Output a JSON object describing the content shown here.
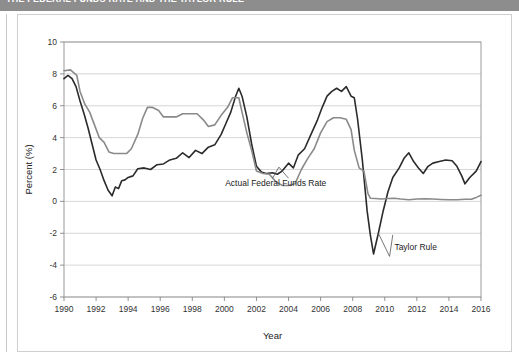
{
  "banner": {
    "caption": "THE FEDERAL FUNDS RATE AND THE TAYLOR RULE"
  },
  "chart_data": {
    "type": "line",
    "title": "",
    "xlabel": "Year",
    "ylabel": "Percent (%)",
    "xlim": [
      1990,
      2016
    ],
    "ylim": [
      -6,
      10
    ],
    "xticks": [
      1990,
      1992,
      1994,
      1996,
      1998,
      2000,
      2002,
      2004,
      2006,
      2008,
      2010,
      2012,
      2014,
      2016
    ],
    "yticks": [
      -6,
      -4,
      -2,
      0,
      2,
      4,
      6,
      8,
      10
    ],
    "grid": "horizontal",
    "legend_position": "inline-annotations",
    "annotations": [
      {
        "text": "Actual Federal Funds Rate",
        "x": 2003.2,
        "y": 0.95
      },
      {
        "text": "Taylor Rule",
        "x": 2010.6,
        "y": -3.05
      }
    ],
    "series": [
      {
        "name": "Taylor Rule",
        "color": "#2b2b2b",
        "width": 1.6,
        "points": [
          [
            1990.0,
            7.7
          ],
          [
            1990.25,
            7.9
          ],
          [
            1990.5,
            7.7
          ],
          [
            1990.75,
            7.2
          ],
          [
            1991.0,
            6.3
          ],
          [
            1991.25,
            5.5
          ],
          [
            1991.5,
            4.6
          ],
          [
            1991.75,
            3.6
          ],
          [
            1992.0,
            2.6
          ],
          [
            1992.25,
            2.0
          ],
          [
            1992.5,
            1.3
          ],
          [
            1992.75,
            0.7
          ],
          [
            1993.0,
            0.35
          ],
          [
            1993.2,
            0.9
          ],
          [
            1993.4,
            0.8
          ],
          [
            1993.6,
            1.3
          ],
          [
            1993.8,
            1.35
          ],
          [
            1994.0,
            1.5
          ],
          [
            1994.3,
            1.6
          ],
          [
            1994.6,
            2.05
          ],
          [
            1995.0,
            2.1
          ],
          [
            1995.4,
            2.0
          ],
          [
            1995.8,
            2.3
          ],
          [
            1996.2,
            2.35
          ],
          [
            1996.6,
            2.6
          ],
          [
            1997.0,
            2.7
          ],
          [
            1997.4,
            3.05
          ],
          [
            1997.8,
            2.75
          ],
          [
            1998.2,
            3.2
          ],
          [
            1998.6,
            3.0
          ],
          [
            1999.0,
            3.4
          ],
          [
            1999.4,
            3.55
          ],
          [
            1999.8,
            4.2
          ],
          [
            2000.1,
            4.9
          ],
          [
            2000.4,
            5.6
          ],
          [
            2000.7,
            6.6
          ],
          [
            2000.9,
            7.1
          ],
          [
            2001.1,
            6.6
          ],
          [
            2001.4,
            5.3
          ],
          [
            2001.7,
            3.6
          ],
          [
            2002.0,
            2.2
          ],
          [
            2002.3,
            1.85
          ],
          [
            2002.6,
            1.75
          ],
          [
            2003.0,
            1.8
          ],
          [
            2003.3,
            1.7
          ],
          [
            2003.6,
            1.9
          ],
          [
            2004.0,
            2.4
          ],
          [
            2004.3,
            2.1
          ],
          [
            2004.6,
            2.9
          ],
          [
            2005.0,
            3.3
          ],
          [
            2005.4,
            4.2
          ],
          [
            2005.8,
            5.1
          ],
          [
            2006.1,
            5.9
          ],
          [
            2006.4,
            6.6
          ],
          [
            2006.7,
            6.9
          ],
          [
            2007.0,
            7.1
          ],
          [
            2007.3,
            6.9
          ],
          [
            2007.6,
            7.2
          ],
          [
            2007.9,
            6.6
          ],
          [
            2008.1,
            6.5
          ],
          [
            2008.3,
            5.2
          ],
          [
            2008.6,
            2.6
          ],
          [
            2008.9,
            -0.6
          ],
          [
            2009.1,
            -2.1
          ],
          [
            2009.3,
            -3.3
          ],
          [
            2009.6,
            -2.0
          ],
          [
            2009.9,
            -0.6
          ],
          [
            2010.2,
            0.6
          ],
          [
            2010.5,
            1.5
          ],
          [
            2010.9,
            2.1
          ],
          [
            2011.2,
            2.7
          ],
          [
            2011.5,
            3.05
          ],
          [
            2011.8,
            2.5
          ],
          [
            2012.1,
            2.1
          ],
          [
            2012.4,
            1.75
          ],
          [
            2012.7,
            2.2
          ],
          [
            2013.0,
            2.4
          ],
          [
            2013.4,
            2.5
          ],
          [
            2013.8,
            2.6
          ],
          [
            2014.2,
            2.55
          ],
          [
            2014.5,
            2.2
          ],
          [
            2014.8,
            1.6
          ],
          [
            2015.0,
            1.1
          ],
          [
            2015.3,
            1.5
          ],
          [
            2015.7,
            1.9
          ],
          [
            2016.0,
            2.5
          ]
        ]
      },
      {
        "name": "Actual Federal Funds Rate",
        "color": "#8a8a8a",
        "width": 1.6,
        "points": [
          [
            1990.0,
            8.2
          ],
          [
            1990.4,
            8.25
          ],
          [
            1990.8,
            7.9
          ],
          [
            1991.0,
            6.9
          ],
          [
            1991.3,
            6.1
          ],
          [
            1991.6,
            5.6
          ],
          [
            1991.9,
            4.8
          ],
          [
            1992.2,
            4.0
          ],
          [
            1992.5,
            3.7
          ],
          [
            1992.8,
            3.1
          ],
          [
            1993.1,
            3.0
          ],
          [
            1993.5,
            3.0
          ],
          [
            1993.9,
            3.0
          ],
          [
            1994.2,
            3.3
          ],
          [
            1994.6,
            4.2
          ],
          [
            1994.9,
            5.2
          ],
          [
            1995.2,
            5.9
          ],
          [
            1995.5,
            5.9
          ],
          [
            1995.9,
            5.7
          ],
          [
            1996.2,
            5.3
          ],
          [
            1996.6,
            5.3
          ],
          [
            1997.0,
            5.3
          ],
          [
            1997.4,
            5.5
          ],
          [
            1997.9,
            5.5
          ],
          [
            1998.3,
            5.5
          ],
          [
            1998.7,
            5.1
          ],
          [
            1999.0,
            4.7
          ],
          [
            1999.4,
            4.8
          ],
          [
            1999.8,
            5.4
          ],
          [
            2000.2,
            5.9
          ],
          [
            2000.5,
            6.5
          ],
          [
            2000.9,
            6.5
          ],
          [
            2001.1,
            5.6
          ],
          [
            2001.4,
            4.3
          ],
          [
            2001.7,
            3.2
          ],
          [
            2002.0,
            1.9
          ],
          [
            2002.4,
            1.75
          ],
          [
            2002.8,
            1.7
          ],
          [
            2003.2,
            1.25
          ],
          [
            2003.6,
            1.0
          ],
          [
            2004.0,
            1.0
          ],
          [
            2004.4,
            1.1
          ],
          [
            2004.8,
            2.0
          ],
          [
            2005.2,
            2.7
          ],
          [
            2005.6,
            3.3
          ],
          [
            2006.0,
            4.3
          ],
          [
            2006.4,
            5.0
          ],
          [
            2006.8,
            5.25
          ],
          [
            2007.2,
            5.25
          ],
          [
            2007.6,
            5.15
          ],
          [
            2007.9,
            4.5
          ],
          [
            2008.1,
            3.2
          ],
          [
            2008.4,
            2.1
          ],
          [
            2008.7,
            1.9
          ],
          [
            2008.95,
            0.5
          ],
          [
            2009.1,
            0.2
          ],
          [
            2009.4,
            0.18
          ],
          [
            2009.8,
            0.15
          ],
          [
            2010.2,
            0.18
          ],
          [
            2010.6,
            0.2
          ],
          [
            2011.0,
            0.15
          ],
          [
            2011.5,
            0.1
          ],
          [
            2012.0,
            0.15
          ],
          [
            2012.5,
            0.16
          ],
          [
            2013.0,
            0.15
          ],
          [
            2013.5,
            0.12
          ],
          [
            2014.0,
            0.1
          ],
          [
            2014.5,
            0.1
          ],
          [
            2015.0,
            0.13
          ],
          [
            2015.4,
            0.13
          ],
          [
            2015.7,
            0.25
          ],
          [
            2016.0,
            0.38
          ]
        ]
      }
    ]
  }
}
